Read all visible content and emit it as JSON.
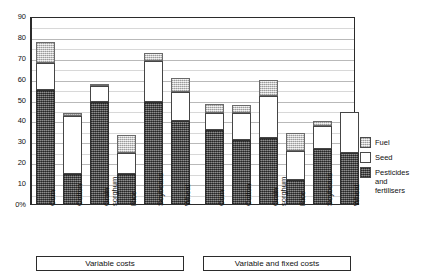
{
  "chart_data": {
    "type": "bar",
    "stacked": true,
    "title": "",
    "subtitle": "",
    "xlabel": "",
    "ylabel": "",
    "ylim": [
      0,
      90
    ],
    "ytick_labels": [
      "90",
      "80",
      "70",
      "60",
      "50",
      "40",
      "30",
      "20",
      "10",
      "0%"
    ],
    "ytick_values": [
      90,
      80,
      70,
      60,
      50,
      40,
      30,
      20,
      10,
      0
    ],
    "grid": true,
    "legend_position": "right",
    "categories": [
      "Corn",
      "Cotton",
      "Grain sorghum",
      "Rice",
      "Soybeans",
      "Wheat"
    ],
    "groups": [
      {
        "name": "Variable costs",
        "caption": "Variable costs",
        "categories": [
          "Corn",
          "Cotton",
          "Grain sorghum",
          "Rice",
          "Soybeans",
          "Wheat"
        ],
        "series": [
          {
            "name": "Pesticides and fertilisers",
            "values": [
              55,
              15,
              49.5,
              15,
              49.5,
              40
            ]
          },
          {
            "name": "Seed",
            "values": [
              13,
              27.5,
              7.5,
              10,
              19.5,
              14
            ]
          },
          {
            "name": "Fuel",
            "values": [
              10,
              1.5,
              1,
              8.5,
              4,
              7
            ]
          }
        ],
        "totals": [
          78,
          44,
          58,
          33.5,
          73,
          61
        ]
      },
      {
        "name": "Variable and fixed costs",
        "caption": "Variable and fixed costs",
        "categories": [
          "Corn",
          "Cotton",
          "Grain sorghum",
          "Rice",
          "Soybeans",
          "Wheat"
        ],
        "series": [
          {
            "name": "Pesticides and fertilisers",
            "values": [
              36,
              31,
              32,
              12,
              27,
              25
            ]
          },
          {
            "name": "Seed",
            "values": [
              8,
              13,
              20,
              14,
              11,
              19.5
            ]
          },
          {
            "name": "Fuel",
            "values": [
              4.5,
              4,
              8,
              8.5,
              2,
              0
            ]
          }
        ],
        "totals": [
          48.5,
          48,
          60,
          34.5,
          40,
          44.5
        ]
      }
    ],
    "legend": [
      {
        "label": "Fuel",
        "pattern": "light-stipple",
        "color": "#d6d6d6"
      },
      {
        "label": "Seed",
        "pattern": "solid-white",
        "color": "#ffffff"
      },
      {
        "label": "Pesticides and fertilisers",
        "pattern": "dark-crosshatch",
        "color": "#5d5d5d"
      }
    ]
  },
  "legend": {
    "items": [
      {
        "label": "Fuel"
      },
      {
        "label": "Seed"
      },
      {
        "label": "Pesticides\nand\nfertilisers"
      }
    ]
  },
  "group_captions": {
    "left": "Variable costs",
    "right": "Variable and fixed costs"
  },
  "colors": {
    "fuel": "#d6d6d6",
    "seed": "#ffffff",
    "pesticides": "#5d5d5d",
    "axis": "#2b2b2b",
    "grid": "#b9b9b9"
  }
}
